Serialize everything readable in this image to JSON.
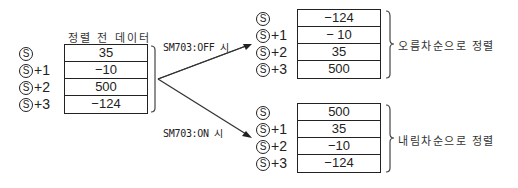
{
  "source": {
    "title": "정렬 전 데이터",
    "labels": [
      "Ⓢ",
      "Ⓢ+1",
      "Ⓢ+2",
      "Ⓢ+3"
    ],
    "label_symbol": "S",
    "offsets": [
      "",
      "+1",
      "+2",
      "+3"
    ],
    "values": [
      "35",
      "−10",
      "500",
      "−124"
    ]
  },
  "branches": [
    {
      "condition": "SM703:OFF 시",
      "offsets": [
        "",
        "+1",
        "+2",
        "+3"
      ],
      "values": [
        "−124",
        "− 10",
        "35",
        "500"
      ],
      "result": "오름차순으로 정렬"
    },
    {
      "condition": "SM703:ON 시",
      "offsets": [
        "",
        "+1",
        "+2",
        "+3"
      ],
      "values": [
        "500",
        "35",
        "−10",
        "−124"
      ],
      "result": "내림차순으로 정렬"
    }
  ]
}
